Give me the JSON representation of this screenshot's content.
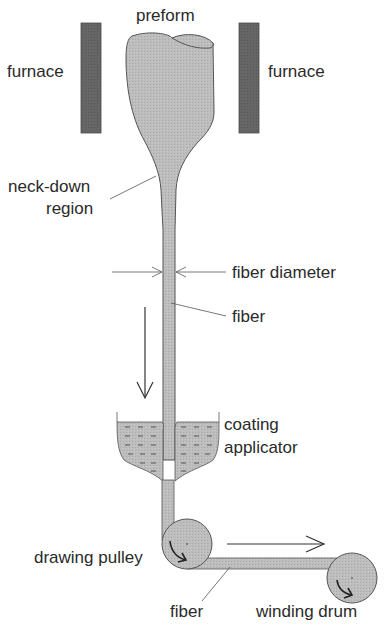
{
  "diagram": {
    "labels": {
      "preform": "preform",
      "furnace_left": "furnace",
      "furnace_right": "furnace",
      "neck_down_line1": "neck-down",
      "neck_down_line2": "region",
      "fiber_diameter": "fiber diameter",
      "fiber_upper": "fiber",
      "coating_line1": "coating",
      "coating_line2": "applicator",
      "drawing_pulley": "drawing pulley",
      "fiber_lower": "fiber",
      "winding_drum": "winding drum"
    },
    "colors": {
      "furnace": "#5f5f5f",
      "glass": "#b8b8b8",
      "outline": "#555555",
      "text": "#2a2a2a",
      "background": "#ffffff"
    }
  }
}
